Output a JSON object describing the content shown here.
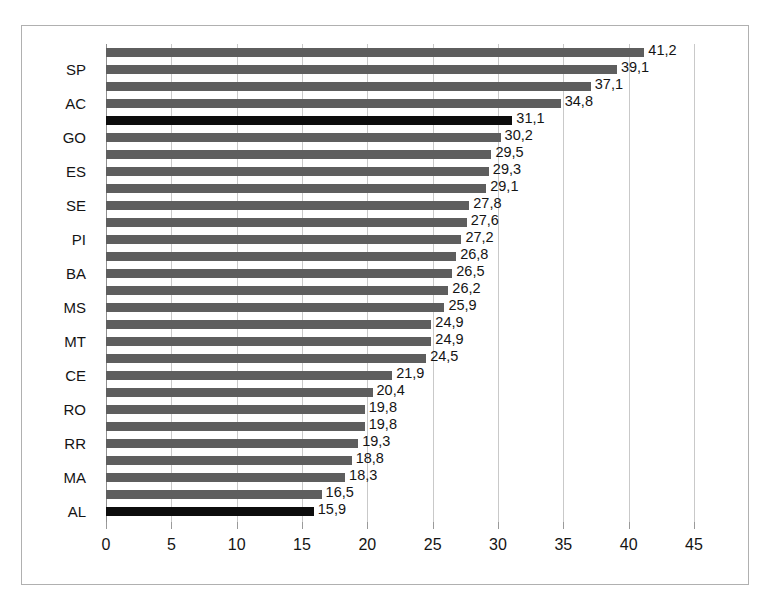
{
  "chart_data": {
    "type": "bar",
    "orientation": "horizontal",
    "title": "",
    "subtitle": "",
    "xlabel": "",
    "ylabel": "",
    "xlim": [
      0,
      45
    ],
    "grid": true,
    "legend": null,
    "decimal_separator": ",",
    "xticks": [
      "0",
      "5",
      "10",
      "15",
      "20",
      "25",
      "30",
      "35",
      "40",
      "45"
    ],
    "xtick_values": [
      0,
      5,
      10,
      15,
      20,
      25,
      30,
      35,
      40,
      45
    ],
    "categories": [
      "",
      "SP",
      "",
      "AC",
      "",
      "GO",
      "",
      "ES",
      "",
      "SE",
      "",
      "PI",
      "",
      "BA",
      "",
      "MS",
      "",
      "MT",
      "",
      "CE",
      "",
      "RO",
      "",
      "RR",
      "",
      "MA",
      "",
      "AL"
    ],
    "visible_category_labels": [
      "SP",
      "AC",
      "GO",
      "ES",
      "SE",
      "PI",
      "BA",
      "MS",
      "MT",
      "CE",
      "RO",
      "RR",
      "MA",
      "AL"
    ],
    "values": [
      41.2,
      39.1,
      37.1,
      34.8,
      31.1,
      30.2,
      29.5,
      29.3,
      29.1,
      27.8,
      27.6,
      27.2,
      26.8,
      26.5,
      26.2,
      25.9,
      24.9,
      24.9,
      24.5,
      21.9,
      20.4,
      19.8,
      19.8,
      19.3,
      18.8,
      18.3,
      16.5,
      15.9
    ],
    "value_labels": [
      "41,2",
      "39,1",
      "37,1",
      "34,8",
      "31,1",
      "30,2",
      "29,5",
      "29,3",
      "29,1",
      "27,8",
      "27,6",
      "27,2",
      "26,8",
      "26,5",
      "26,2",
      "25,9",
      "24,9",
      "24,9",
      "24,5",
      "21,9",
      "20,4",
      "19,8",
      "19,8",
      "19,3",
      "18,8",
      "18,3",
      "16,5",
      "15,9"
    ],
    "highlighted_indices": [
      4,
      27
    ],
    "colors": {
      "bar": "#5e5e5e",
      "bar_highlight": "#0d0d0d",
      "gridline": "#c9c9c9",
      "axis": "#8f8f8f",
      "frame_border": "#b0b0b0",
      "background": "#ffffff",
      "text": "#141414"
    }
  }
}
